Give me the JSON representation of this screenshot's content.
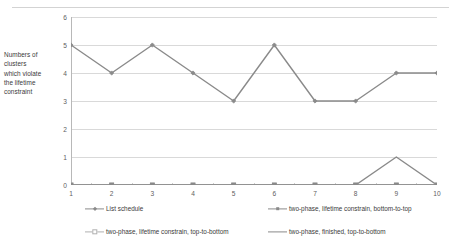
{
  "chart_data": {
    "type": "line",
    "title": "",
    "xlabel": "",
    "ylabel": "Numbers of clusters which violate the lifetime constraint",
    "ylabel_lines": [
      "Numbers of",
      "clusters",
      "which violate",
      "the lifetime",
      "constraint"
    ],
    "x": [
      1,
      2,
      3,
      4,
      5,
      6,
      7,
      8,
      9,
      10
    ],
    "categories": [
      "1",
      "2",
      "3",
      "4",
      "5",
      "6",
      "7",
      "8",
      "9",
      "10"
    ],
    "xlim": [
      1,
      10
    ],
    "ylim": [
      0,
      6
    ],
    "yticks": [
      0,
      1,
      2,
      3,
      4,
      5,
      6
    ],
    "ytick_labels": [
      "0",
      "1",
      "2",
      "3",
      "4",
      "5",
      "6"
    ],
    "grid": "horizontal",
    "legend_position": "bottom",
    "series": [
      {
        "name": "List schedule",
        "values": [
          5,
          4,
          5,
          4,
          3,
          5,
          3,
          3,
          4,
          4
        ],
        "color": "#8a8a8a",
        "marker": "diamond"
      },
      {
        "name": "two-phase, lifetime constrain, bottom-to-top",
        "values": [
          0,
          0,
          0,
          0,
          0,
          0,
          0,
          0,
          0,
          0
        ],
        "color": "#8a8a8a",
        "marker": "square"
      },
      {
        "name": "two-phase, lifetime constrain, top-to-bottom",
        "values": [
          0,
          0,
          0,
          0,
          0,
          0,
          0,
          0,
          0,
          0
        ],
        "color": "#b0b0b0",
        "marker": "square-open"
      },
      {
        "name": "two-phase, finished, top-to-bottom",
        "values": [
          0,
          0,
          0,
          0,
          0,
          0,
          0,
          0,
          1,
          0
        ],
        "color": "#8a8a8a",
        "marker": "none"
      }
    ]
  },
  "legend": {
    "items": [
      {
        "label": "List schedule"
      },
      {
        "label": "two-phase, lifetime constrain, bottom-to-top"
      },
      {
        "label": "two-phase, lifetime constrain, top-to-bottom"
      },
      {
        "label": "two-phase, finished, top-to-bottom"
      }
    ]
  },
  "colors": {
    "axis": "#b8b8b8",
    "grid": "#d9d9d9",
    "text": "#3a3a3a",
    "tick_text": "#606060",
    "top_rule": "#d3d3d3"
  }
}
